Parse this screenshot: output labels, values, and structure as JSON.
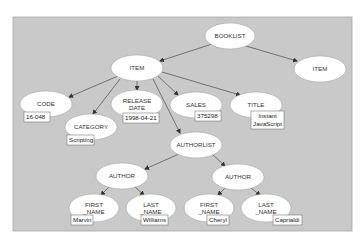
{
  "diagram": {
    "type": "tree",
    "background": "#c9c9c9",
    "node_fill": "#ffffff",
    "edge_color": "#666666",
    "nodes": [
      {
        "id": "booklist",
        "label": [
          "BOOKLIST"
        ],
        "cx": 230,
        "cy": 36,
        "rx": 25,
        "ry": 13
      },
      {
        "id": "item_right",
        "label": [
          "ITEM"
        ],
        "cx": 320,
        "cy": 69,
        "rx": 26,
        "ry": 13
      },
      {
        "id": "item",
        "label": [
          "ITEM"
        ],
        "cx": 137,
        "cy": 68,
        "rx": 26,
        "ry": 13
      },
      {
        "id": "code",
        "label": [
          "CODE"
        ],
        "cx": 46,
        "cy": 104,
        "rx": 26,
        "ry": 13
      },
      {
        "id": "release_date",
        "label": [
          "RELEASE",
          "DATE"
        ],
        "cx": 137,
        "cy": 104,
        "rx": 26,
        "ry": 14
      },
      {
        "id": "sales",
        "label": [
          "SALES"
        ],
        "cx": 196,
        "cy": 105,
        "rx": 26,
        "ry": 13
      },
      {
        "id": "title",
        "label": [
          "TITLE"
        ],
        "cx": 256,
        "cy": 105,
        "rx": 26,
        "ry": 13
      },
      {
        "id": "category",
        "label": [
          "CATEGORY"
        ],
        "cx": 91,
        "cy": 127,
        "rx": 26,
        "ry": 13
      },
      {
        "id": "authorlist",
        "label": [
          "AUTHORLIST"
        ],
        "cx": 196,
        "cy": 145,
        "rx": 26,
        "ry": 13
      },
      {
        "id": "author_left",
        "label": [
          "AUTHOR"
        ],
        "cx": 122,
        "cy": 176,
        "rx": 26,
        "ry": 13
      },
      {
        "id": "author_right",
        "label": [
          "AUTHOR"
        ],
        "cx": 238,
        "cy": 177,
        "rx": 26,
        "ry": 13
      },
      {
        "id": "first_name_left",
        "label": [
          "FIRST",
          "_NAME"
        ],
        "cx": 94,
        "cy": 208,
        "rx": 25,
        "ry": 14
      },
      {
        "id": "last_name_left",
        "label": [
          "LAST",
          "_NAME"
        ],
        "cx": 151,
        "cy": 208,
        "rx": 25,
        "ry": 14
      },
      {
        "id": "first_name_right",
        "label": [
          "FIRST",
          "_NAME"
        ],
        "cx": 209,
        "cy": 208,
        "rx": 25,
        "ry": 14
      },
      {
        "id": "last_name_right",
        "label": [
          "LAST",
          "_NAME"
        ],
        "cx": 266,
        "cy": 208,
        "rx": 25,
        "ry": 14
      }
    ],
    "edges": [
      {
        "from": "booklist",
        "to": "item",
        "x1": 212,
        "y1": 44,
        "x2": 160,
        "y2": 61
      },
      {
        "from": "booklist",
        "to": "item_right",
        "x1": 246,
        "y1": 46,
        "x2": 297,
        "y2": 61
      },
      {
        "from": "item",
        "to": "code",
        "x1": 118,
        "y1": 76,
        "x2": 69,
        "y2": 97
      },
      {
        "from": "item",
        "to": "category",
        "x1": 120,
        "y1": 79,
        "x2": 93,
        "y2": 114
      },
      {
        "from": "item",
        "to": "release_date",
        "x1": 137,
        "y1": 81,
        "x2": 137,
        "y2": 90
      },
      {
        "from": "item",
        "to": "authorlist",
        "x1": 153,
        "y1": 79,
        "x2": 180,
        "y2": 133
      },
      {
        "from": "item",
        "to": "sales",
        "x1": 158,
        "y1": 76,
        "x2": 178,
        "y2": 95
      },
      {
        "from": "item",
        "to": "title",
        "x1": 162,
        "y1": 72,
        "x2": 240,
        "y2": 95
      },
      {
        "from": "authorlist",
        "to": "author_left",
        "x1": 179,
        "y1": 154,
        "x2": 145,
        "y2": 169
      },
      {
        "from": "authorlist",
        "to": "author_right",
        "x1": 212,
        "y1": 154,
        "x2": 225,
        "y2": 166
      },
      {
        "from": "author_left",
        "to": "first_name_left",
        "x1": 109,
        "y1": 187,
        "x2": 101,
        "y2": 195
      },
      {
        "from": "author_left",
        "to": "last_name_left",
        "x1": 135,
        "y1": 187,
        "x2": 144,
        "y2": 195
      },
      {
        "from": "author_right",
        "to": "first_name_right",
        "x1": 225,
        "y1": 188,
        "x2": 218,
        "y2": 195
      },
      {
        "from": "author_right",
        "to": "last_name_right",
        "x1": 251,
        "y1": 188,
        "x2": 260,
        "y2": 195
      }
    ],
    "values": [
      {
        "node": "code",
        "text": [
          "16-048"
        ],
        "x": 24,
        "y": 112,
        "w": 26,
        "h": 10
      },
      {
        "node": "release_date",
        "text": [
          "1998-04-21"
        ],
        "x": 123,
        "y": 113,
        "w": 36,
        "h": 10
      },
      {
        "node": "sales",
        "text": [
          "375298"
        ],
        "x": 195,
        "y": 111,
        "w": 26,
        "h": 10
      },
      {
        "node": "title",
        "text": [
          "Instant",
          "JavaScript"
        ],
        "x": 251,
        "y": 111,
        "w": 33,
        "h": 18
      },
      {
        "node": "category",
        "text": [
          "Scripting"
        ],
        "x": 67,
        "y": 135,
        "w": 27,
        "h": 10
      },
      {
        "node": "first_name_left",
        "text": [
          "Marvin"
        ],
        "x": 71,
        "y": 215,
        "w": 22,
        "h": 10
      },
      {
        "node": "last_name_left",
        "text": [
          "Williams"
        ],
        "x": 141,
        "y": 215,
        "w": 27,
        "h": 10
      },
      {
        "node": "first_name_right",
        "text": [
          "Cheryl"
        ],
        "x": 207,
        "y": 215,
        "w": 22,
        "h": 10
      },
      {
        "node": "last_name_right",
        "text": [
          "Caprialdi"
        ],
        "x": 273,
        "y": 215,
        "w": 29,
        "h": 10
      }
    ]
  }
}
